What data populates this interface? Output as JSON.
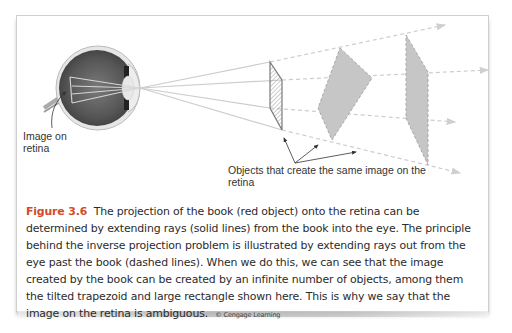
{
  "figure": {
    "number": "Figure 3.6",
    "caption": "The projection of the book (red object) onto the retina can be determined by extending rays (solid lines) from the book into the eye. The principle behind the inverse projection problem is illustrated by extending rays out from the eye past the book (dashed lines). When we do this, we can see that the image created by the book can be created by an infinite number of objects, among them the tilted trapezoid and large rectangle shown here. This is why we say that the image on the retina is ambiguous.",
    "credit": "© Cengage Learning",
    "accent_color": "#d24a2a"
  },
  "diagram": {
    "labels": {
      "retina": "Image on retina",
      "objects": "Objects that create the same image on the retina"
    },
    "elements": [
      {
        "name": "eye",
        "type": "anatomical-eye",
        "focal_point": [
          140,
          88
        ]
      },
      {
        "name": "book",
        "type": "parallelogram",
        "style": "solid-outline-hatched"
      },
      {
        "name": "tilted-trapezoid",
        "type": "quadrilateral",
        "style": "dashed-filled-gray"
      },
      {
        "name": "large-rectangle",
        "type": "quadrilateral",
        "style": "dashed-filled-gray"
      }
    ],
    "rays": {
      "solid": "from book corners into eye",
      "dashed": "extended from book outward past objects"
    },
    "colors": {
      "ray": "#c9c9c9",
      "object_fill": "#c4c4c4",
      "eye_dark": "#5a5a5a",
      "book_edge": "#7a7a7a"
    }
  }
}
